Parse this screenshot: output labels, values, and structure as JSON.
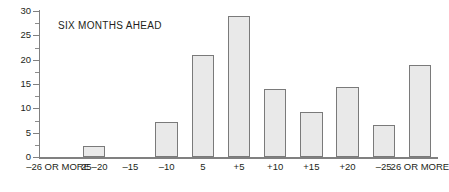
{
  "chart_data": {
    "type": "bar",
    "title": "SIX MONTHS AHEAD",
    "xlabel": "",
    "ylabel": "",
    "ylim": [
      0,
      30
    ],
    "ytick_step": 5,
    "yticks": [
      0,
      5,
      10,
      15,
      20,
      25,
      30
    ],
    "ytick_labels": [
      "0",
      "5",
      "10",
      "15",
      "20",
      "25",
      "30"
    ],
    "minor_ticks": true,
    "grid": false,
    "legend": null,
    "categories": [
      "–26 OR MORE",
      "25–20",
      "–15",
      "–10",
      "5",
      "+5",
      "+10",
      "+15",
      "+20",
      "–25",
      "26 OR MORE"
    ],
    "values": [
      0,
      2.3,
      0,
      7.2,
      21,
      29,
      14,
      9.3,
      14.4,
      6.6,
      19
    ],
    "bar_fill": "#e9e9e9",
    "bar_edge": "#7a7a7a",
    "axis_color": "#808080",
    "text_color": "#231f20",
    "background": "#ffffff"
  }
}
